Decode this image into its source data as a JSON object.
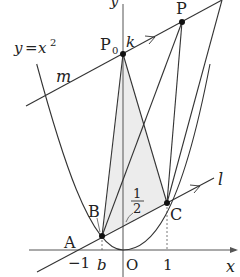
{
  "diagram": {
    "curve_label": "y=x²",
    "curve_label_parts": {
      "y": "y",
      "eq": "=",
      "x": "x",
      "exp": "2"
    },
    "axis_labels": {
      "x": "x",
      "y": "y"
    },
    "origin_label": "O",
    "tick_labels": {
      "neg_one": "−1",
      "b": "b",
      "one": "1"
    },
    "points": {
      "P0": {
        "label": "P",
        "sub": "0"
      },
      "P": {
        "label": "P"
      },
      "A": {
        "label": "A"
      },
      "B": {
        "label": "B"
      },
      "C": {
        "label": "C"
      }
    },
    "line_labels": {
      "k": "k",
      "m": "m",
      "l": "l"
    },
    "fraction": {
      "num": "1",
      "den": "2"
    },
    "colors": {
      "stroke": "#333333",
      "shade": "#ececec",
      "background": "#ffffff"
    }
  }
}
